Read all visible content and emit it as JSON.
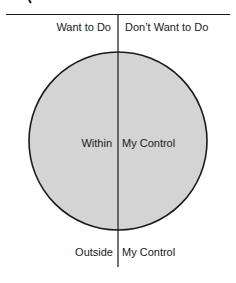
{
  "diagram": {
    "type": "circle-quadrant",
    "columns": {
      "left_header": "Want to Do",
      "right_header": "Don’t Want to Do"
    },
    "inside": {
      "left": "Within",
      "right": "My Control"
    },
    "outside": {
      "left": "Outside",
      "right": "My Control"
    },
    "colors": {
      "circle_fill": "#d4d4d4",
      "line": "#1a1a1a",
      "background": "#ffffff"
    }
  }
}
